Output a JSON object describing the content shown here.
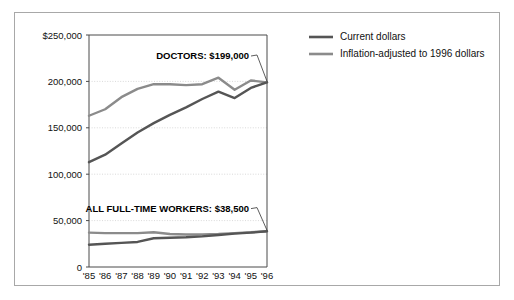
{
  "figure": {
    "border_color": "#a8a8a8",
    "background": "#ffffff"
  },
  "legend": {
    "position": "top-right",
    "items": [
      {
        "label": "Current dollars",
        "color": "#555555"
      },
      {
        "label": "Inflation-adjusted to 1996 dollars",
        "color": "#8b8b8b"
      }
    ]
  },
  "annotations": [
    {
      "name": "doctors",
      "text": "DOCTORS: $199,000"
    },
    {
      "name": "all-full-time-workers",
      "text": "ALL FULL-TIME WORKERS: $38,500"
    }
  ],
  "chart_data": {
    "type": "line",
    "title": "",
    "xlabel": "",
    "ylabel": "",
    "grid": true,
    "legend_position": "top-right",
    "x": [
      "'85",
      "'86",
      "'87",
      "'88",
      "'89",
      "'90",
      "'91",
      "'92",
      "'93",
      "'94",
      "'95",
      "'96"
    ],
    "ylim": [
      0,
      250000
    ],
    "yticks": [
      0,
      50000,
      100000,
      150000,
      200000,
      250000
    ],
    "ytick_labels": [
      "0",
      "50,000",
      "100,000",
      "150,000",
      "200,000",
      "$250,000"
    ],
    "series": [
      {
        "name": "Doctors - Current dollars",
        "legend": "Current dollars",
        "color": "#555555",
        "values": [
          113000,
          121000,
          133000,
          145000,
          155000,
          164000,
          172000,
          181000,
          189000,
          182000,
          193000,
          199000
        ]
      },
      {
        "name": "Doctors - Inflation-adjusted to 1996 dollars",
        "legend": "Inflation-adjusted to 1996 dollars",
        "color": "#8b8b8b",
        "values": [
          163000,
          170000,
          183000,
          192000,
          197000,
          197000,
          196000,
          197000,
          204000,
          191000,
          201000,
          199000
        ]
      },
      {
        "name": "All full-time workers - Current dollars",
        "legend": "Current dollars",
        "color": "#555555",
        "values": [
          24000,
          25000,
          26000,
          27000,
          31000,
          31500,
          32000,
          33000,
          34500,
          36000,
          37000,
          38500
        ]
      },
      {
        "name": "All full-time workers - Inflation-adjusted to 1996 dollars",
        "legend": "Inflation-adjusted to 1996 dollars",
        "color": "#8b8b8b",
        "values": [
          37000,
          36500,
          36500,
          36500,
          37500,
          35500,
          35000,
          35000,
          35500,
          36500,
          37500,
          38500
        ]
      }
    ]
  }
}
